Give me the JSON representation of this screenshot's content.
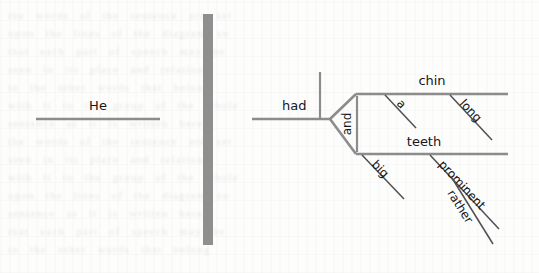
{
  "image": {
    "kind": "scanned-page-figure",
    "subject": "reed-kellogg-sentence-diagram",
    "width": 539,
    "height": 273,
    "background_color": "#fdfdfc",
    "ghost_text_note": "faint illegible bleed-through text from the reverse of the scanned page"
  },
  "colors": {
    "structure_line": "#8c8c8c",
    "modifier_line": "#4f4f55",
    "divider_bar": "#8f8f8f",
    "handwriting": "#17171a",
    "ghost": "rgba(110,110,125,0.16)"
  },
  "panels": {
    "left": {
      "name": "subject-panel",
      "baseline_label": "He"
    },
    "divider": {
      "name": "vertical-separator-bar",
      "x": 203,
      "y": 14,
      "width": 10,
      "height": 231
    },
    "right": {
      "name": "predicate-panel",
      "verb": "had",
      "conjunction": "and",
      "branches": [
        {
          "head": "chin",
          "modifiers": [
            {
              "word": "a"
            },
            {
              "word": "long"
            }
          ]
        },
        {
          "head": "teeth",
          "modifiers": [
            {
              "word": "big"
            },
            {
              "word": "prominent",
              "submodifier": "rather"
            }
          ]
        }
      ]
    }
  },
  "labels": {
    "he": "He",
    "had": "had",
    "and": "and",
    "a": "a",
    "chin": "chin",
    "long": "long",
    "teeth": "teeth",
    "big": "big",
    "prominent": "prominent",
    "rather": "rather"
  },
  "ghost_lines": [
    "the words of the sentence are set",
    "upon the lines of the diagram so",
    "that each part of speech may be",
    "seen in its place and relation",
    "to the other words that belong",
    "with it in the group of the whole",
    "sentence as it is written here"
  ]
}
